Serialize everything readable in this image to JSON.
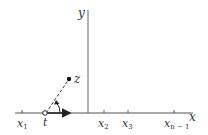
{
  "diagram": {
    "axes": {
      "x_label": "x",
      "y_label": "y"
    },
    "points": {
      "z_label": "z",
      "t_label": "t"
    },
    "ticks": [
      {
        "label": "x",
        "sub": "1"
      },
      {
        "label": "x",
        "sub": "2"
      },
      {
        "label": "x",
        "sub": "3"
      },
      {
        "label": "x",
        "sub": "n − 1"
      }
    ],
    "colors": {
      "line": "#555555",
      "text": "#333333",
      "background": "#ffffff"
    }
  }
}
